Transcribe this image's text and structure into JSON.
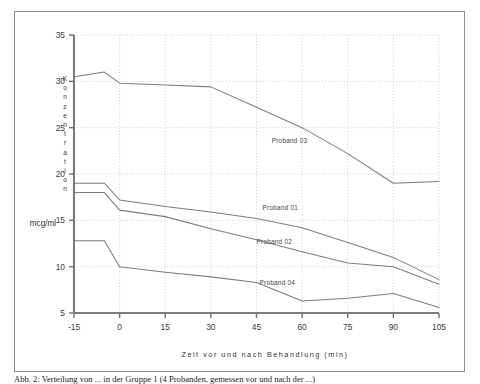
{
  "figure": {
    "caption": "Abb. 2: Verteilung von ... in der Gruppe 1 (4 Probanden, gemessen vor und nach der ...)",
    "y_axis_title_letters": [
      "K",
      "o",
      "n",
      "z",
      "e",
      "n",
      "t",
      "r",
      "a",
      "t",
      "i",
      "o",
      "n"
    ],
    "unit_label": "mcg/ml",
    "x_axis_title": "Zeit vor und nach Behandlung (min)"
  },
  "chart_data": {
    "type": "line",
    "title": "",
    "xlabel": "Zeit vor und nach Behandlung (min)",
    "ylabel": "Konzentration",
    "yunit": "mcg/ml",
    "xlim": [
      -15,
      105
    ],
    "ylim": [
      5,
      35
    ],
    "xticks": [
      -15,
      0,
      15,
      30,
      45,
      60,
      75,
      90,
      105
    ],
    "yticks": [
      5,
      10,
      15,
      20,
      25,
      30,
      35
    ],
    "grid": true,
    "legend_position": "inline-annotations",
    "series": [
      {
        "name": "Proband 01",
        "label_x": 47,
        "label_y": 16.1,
        "x": [
          -15,
          -5,
          0,
          15,
          30,
          45,
          60,
          75,
          90,
          105
        ],
        "values": [
          19.0,
          19.0,
          17.2,
          16.5,
          15.9,
          15.2,
          14.2,
          12.6,
          11.0,
          8.6
        ]
      },
      {
        "name": "Proband 02",
        "label_x": 45,
        "label_y": 12.5,
        "x": [
          -15,
          -5,
          0,
          15,
          30,
          45,
          60,
          75,
          90,
          105
        ],
        "values": [
          18.0,
          18.0,
          16.1,
          15.4,
          14.1,
          12.9,
          11.6,
          10.4,
          10.0,
          8.1
        ]
      },
      {
        "name": "Proband 03",
        "label_x": 50,
        "label_y": 23.3,
        "x": [
          -15,
          -5,
          0,
          15,
          30,
          45,
          60,
          75,
          90,
          105
        ],
        "values": [
          30.5,
          31.0,
          29.8,
          29.6,
          29.4,
          27.2,
          25.0,
          22.2,
          19.0,
          19.2
        ]
      },
      {
        "name": "Proband 04",
        "label_x": 46,
        "label_y": 8.0,
        "x": [
          -15,
          -5,
          0,
          15,
          30,
          45,
          60,
          75,
          90,
          105
        ],
        "values": [
          12.8,
          12.8,
          10.0,
          9.4,
          8.9,
          8.3,
          6.3,
          6.6,
          7.1,
          5.6
        ]
      }
    ]
  }
}
